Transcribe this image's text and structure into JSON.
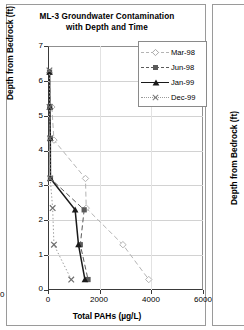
{
  "figure": {
    "panel_main_name": "ml3-chart-panel",
    "panel_adjacent_name": "adjacent-chart-panel"
  },
  "chart_data": {
    "type": "line",
    "title": "ML-3 Groundwater Contamination with Depth and Time",
    "title_line1": "ML-3 Groundwater Contamination",
    "title_line2": "with Depth and Time",
    "xlabel": "Total PAHs (µg/L)",
    "ylabel": "Depth from Bedrock (ft)",
    "xlim": [
      0,
      6000
    ],
    "ylim": [
      0,
      7
    ],
    "xticks": [
      0,
      2000,
      4000,
      6000
    ],
    "xtick_labels": [
      "0",
      "2000",
      "4000",
      "6000"
    ],
    "yticks": [
      0,
      1,
      2,
      3,
      4,
      5,
      6,
      7
    ],
    "ytick_labels": [
      "0",
      "1",
      "2",
      "3",
      "4",
      "5",
      "6",
      "7"
    ],
    "grid": "horizontal",
    "legend_position": "top-right",
    "orientation": "x = concentration, y = depth from bedrock",
    "series": [
      {
        "name": "Mar-98",
        "marker": "open-diamond",
        "line": "dashed",
        "color": "#b4b4b4",
        "points": [
          {
            "x": 150,
            "y": 5.25
          },
          {
            "x": 230,
            "y": 4.3
          },
          {
            "x": 1450,
            "y": 3.2
          },
          {
            "x": 1480,
            "y": 2.35
          },
          {
            "x": 2900,
            "y": 1.3
          },
          {
            "x": 3900,
            "y": 0.3
          }
        ]
      },
      {
        "name": "Jun-98",
        "marker": "filled-square",
        "line": "dashed",
        "color": "#5a5a5a",
        "points": [
          {
            "x": 60,
            "y": 6.25
          },
          {
            "x": 70,
            "y": 5.25
          },
          {
            "x": 90,
            "y": 4.35
          },
          {
            "x": 95,
            "y": 3.2
          },
          {
            "x": 1400,
            "y": 2.3
          },
          {
            "x": 1250,
            "y": 1.3
          },
          {
            "x": 1550,
            "y": 0.3
          }
        ]
      },
      {
        "name": "Jan-99",
        "marker": "filled-triangle",
        "line": "solid",
        "color": "#1a1a1a",
        "points": [
          {
            "x": 60,
            "y": 6.25
          },
          {
            "x": 70,
            "y": 5.25
          },
          {
            "x": 90,
            "y": 4.35
          },
          {
            "x": 95,
            "y": 3.2
          },
          {
            "x": 1050,
            "y": 2.3
          },
          {
            "x": 1180,
            "y": 1.3
          },
          {
            "x": 1430,
            "y": 0.3
          }
        ]
      },
      {
        "name": "Dec-99",
        "marker": "cross-x",
        "line": "dotted",
        "color": "#9a9a9a",
        "points": [
          {
            "x": 55,
            "y": 6.3
          },
          {
            "x": 60,
            "y": 5.25
          },
          {
            "x": 80,
            "y": 4.35
          },
          {
            "x": 85,
            "y": 3.2
          },
          {
            "x": 180,
            "y": 2.35
          },
          {
            "x": 230,
            "y": 1.3
          },
          {
            "x": 900,
            "y": 0.3
          }
        ]
      }
    ]
  },
  "adjacent_panel": {
    "ylabel": "Depth from Bedrock (ft)",
    "ytick_labels": [
      "7",
      "6",
      "5",
      "4",
      "3",
      "2",
      "1",
      "0"
    ],
    "xtick_partial": "0"
  }
}
